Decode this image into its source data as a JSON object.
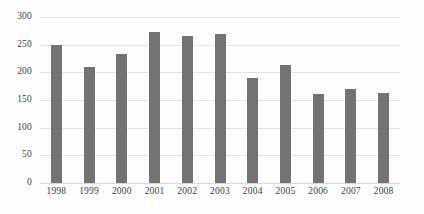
{
  "chart_data": {
    "type": "bar",
    "title": "",
    "subtitle": "",
    "xlabel": "",
    "ylabel": "",
    "categories": [
      "1998",
      "1999",
      "2000",
      "2001",
      "2002",
      "2003",
      "2004",
      "2005",
      "2006",
      "2007",
      "2008"
    ],
    "values": [
      249,
      210,
      233,
      273,
      266,
      269,
      190,
      213,
      161,
      170,
      163
    ],
    "ylim": [
      0,
      300
    ],
    "yticks": [
      0,
      50,
      100,
      150,
      200,
      250,
      300
    ],
    "ytick_labels": [
      "0",
      "50",
      "100",
      "150",
      "200",
      "250",
      "300"
    ],
    "grid": "horizontal",
    "legend": null,
    "series": [
      {
        "name": "",
        "values": [
          249,
          210,
          233,
          273,
          266,
          269,
          190,
          213,
          161,
          170,
          163
        ]
      }
    ],
    "colors": {
      "bar": "#737373",
      "gridline": "#e3e3e3",
      "baseline": "#d8d8d8",
      "background": "#fdfdfd",
      "text": "#3d3d3d"
    }
  }
}
